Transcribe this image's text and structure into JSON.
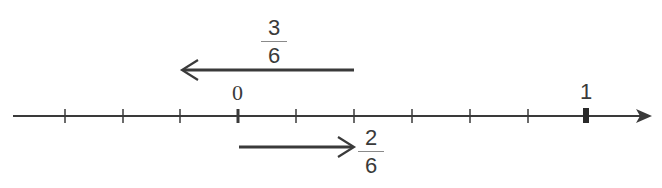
{
  "diagram": {
    "type": "number_line",
    "colors": {
      "line": "#3a3a3a",
      "text": "#3a3a3a",
      "fraction_bar": "#8a8a8a",
      "background": "#ffffff"
    },
    "axis": {
      "start_px": 13,
      "end_px": 652,
      "y_px": 116,
      "unit_step": "1/6",
      "tick_spacing_px": 58,
      "ticks": [
        {
          "value": "-3/6",
          "x": 65,
          "emphasized": false
        },
        {
          "value": "-2/6",
          "x": 123,
          "emphasized": false
        },
        {
          "value": "-1/6",
          "x": 180,
          "emphasized": false
        },
        {
          "value": "0",
          "x": 238,
          "emphasized": true
        },
        {
          "value": "1/6",
          "x": 296,
          "emphasized": false
        },
        {
          "value": "2/6",
          "x": 354,
          "emphasized": false
        },
        {
          "value": "3/6",
          "x": 412,
          "emphasized": false
        },
        {
          "value": "4/6",
          "x": 470,
          "emphasized": false
        },
        {
          "value": "5/6",
          "x": 528,
          "emphasized": false
        },
        {
          "value": "1",
          "x": 586,
          "emphasized": true
        }
      ]
    },
    "labels": {
      "zero": "0",
      "one": "1"
    },
    "arrows": [
      {
        "name": "subtract-three-sixths",
        "direction": "left",
        "from_value": "2/6",
        "to_value": "-1/6",
        "label": {
          "numerator": "3",
          "denominator": "6"
        }
      },
      {
        "name": "add-two-sixths",
        "direction": "right",
        "from_value": "0",
        "to_value": "2/6",
        "label": {
          "numerator": "2",
          "denominator": "6"
        }
      }
    ]
  }
}
